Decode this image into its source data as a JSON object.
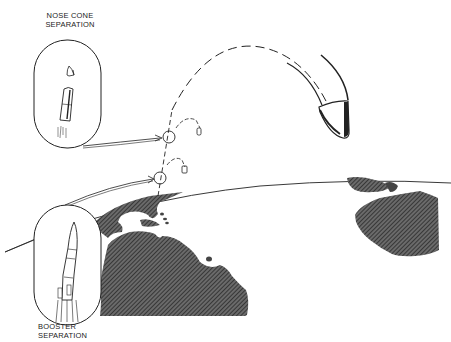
{
  "diagram": {
    "type": "technical-illustration",
    "labels": {
      "nose_cone_line1": "NOSE CONE",
      "nose_cone_line2": "SEPARATION",
      "booster_line1": "BOOSTER",
      "booster_line2": "SEPARATION"
    },
    "nodes": [
      {
        "id": "booster-separation-point",
        "label": "BOOSTER SEPARATION",
        "x": 160,
        "y": 178
      },
      {
        "id": "nose-cone-separation-point",
        "label": "NOSE CONE SEPARATION",
        "x": 169,
        "y": 136
      },
      {
        "id": "reentry-vehicle",
        "label": "",
        "x": 330,
        "y": 120
      }
    ],
    "edges": [
      {
        "from": "booster-separation-point",
        "to": "nose-cone-separation-point",
        "style": "dashed"
      },
      {
        "from": "nose-cone-separation-point",
        "to": "reentry-vehicle",
        "style": "dashed-arc"
      }
    ],
    "colors": {
      "ink": "#222222",
      "land_fill": "#555555",
      "background": "#ffffff"
    }
  }
}
